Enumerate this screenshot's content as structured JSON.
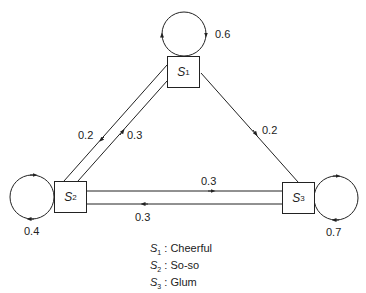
{
  "diagram": {
    "type": "markov-chain-state-transition",
    "states": [
      {
        "id": "S1",
        "symbol": "S",
        "sub": "1",
        "meaning": "Cheerful",
        "self_loop": "0.6"
      },
      {
        "id": "S2",
        "symbol": "S",
        "sub": "2",
        "meaning": "So-so",
        "self_loop": "0.4"
      },
      {
        "id": "S3",
        "symbol": "S",
        "sub": "3",
        "meaning": "Glum",
        "self_loop": "0.7"
      }
    ],
    "transitions": [
      {
        "from": "S1",
        "to": "S1",
        "p": "0.6"
      },
      {
        "from": "S1",
        "to": "S2",
        "p": "0.2"
      },
      {
        "from": "S1",
        "to": "S3",
        "p": "0.2"
      },
      {
        "from": "S2",
        "to": "S1",
        "p": "0.3"
      },
      {
        "from": "S2",
        "to": "S2",
        "p": "0.4"
      },
      {
        "from": "S2",
        "to": "S3",
        "p": "0.3"
      },
      {
        "from": "S3",
        "to": "S2",
        "p": "0.3"
      },
      {
        "from": "S3",
        "to": "S3",
        "p": "0.7"
      }
    ],
    "legend": [
      {
        "symbol": "S",
        "sub": "1",
        "sep": " : ",
        "text": "Cheerful"
      },
      {
        "symbol": "S",
        "sub": "2",
        "sep": " : ",
        "text": "So-so"
      },
      {
        "symbol": "S",
        "sub": "3",
        "sep": " : ",
        "text": "Glum"
      }
    ],
    "colors": {
      "line": "#222222",
      "background": "#ffffff"
    }
  }
}
